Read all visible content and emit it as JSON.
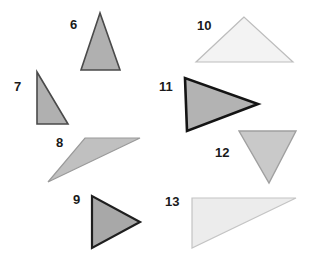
{
  "figure": {
    "background_color": "#ffffff",
    "width": 317,
    "height": 264,
    "label_color": "#1a1a1a"
  },
  "shapes": [
    {
      "label": "6",
      "name": "triangle-6",
      "kind": "triangle",
      "orientation": "isosceles-pointing-up",
      "points": "100,13 81,70 120,70",
      "fill": "#b0b0b0",
      "stroke": "#4a4a4a",
      "stroke_width": 1.6,
      "label_x": 70,
      "label_y": 29
    },
    {
      "label": "7",
      "name": "triangle-7",
      "kind": "triangle",
      "orientation": "right-triangle-vertical-left-leg",
      "points": "37,72 37,124 68,124",
      "fill": "#b0b0b0",
      "stroke": "#4a4a4a",
      "stroke_width": 1.6,
      "label_x": 14,
      "label_y": 91
    },
    {
      "label": "8",
      "name": "triangle-8",
      "kind": "triangle",
      "orientation": "obtuse-scalene-pointing-left",
      "points": "85,138 140,138 48,182",
      "fill": "#c0c0c0",
      "stroke": "#9a9a9a",
      "stroke_width": 1.2,
      "label_x": 56,
      "label_y": 147
    },
    {
      "label": "9",
      "name": "triangle-9",
      "kind": "triangle",
      "orientation": "isosceles-pointing-right",
      "points": "92,196 92,248 140,222",
      "fill": "#a8a8a8",
      "stroke": "#1f1f1f",
      "stroke_width": 2.2,
      "label_x": 73,
      "label_y": 204
    },
    {
      "label": "10",
      "name": "triangle-10",
      "kind": "triangle",
      "orientation": "isosceles-pointing-up-wide",
      "points": "244,17 196,62 293,62",
      "fill": "#f3f3f3",
      "stroke": "#bdbdbd",
      "stroke_width": 1.2,
      "label_x": 197,
      "label_y": 30
    },
    {
      "label": "11",
      "name": "triangle-11",
      "kind": "triangle",
      "orientation": "isosceles-pointing-right",
      "points": "185,78 187,131 258,104",
      "fill": "#b3b3b3",
      "stroke": "#141414",
      "stroke_width": 2.6,
      "label_x": 159,
      "label_y": 91
    },
    {
      "label": "12",
      "name": "triangle-12",
      "kind": "triangle",
      "orientation": "isosceles-pointing-down",
      "points": "239,131 296,131 269,183",
      "fill": "#c9c9c9",
      "stroke": "#a0a0a0",
      "stroke_width": 1.4,
      "label_x": 215,
      "label_y": 157
    },
    {
      "label": "13",
      "name": "triangle-13",
      "kind": "triangle",
      "orientation": "right-triangle-left-angle",
      "points": "192,198 296,198 192,248",
      "fill": "#ececec",
      "stroke": "#c4c4c4",
      "stroke_width": 1.2,
      "label_x": 165,
      "label_y": 206
    }
  ]
}
